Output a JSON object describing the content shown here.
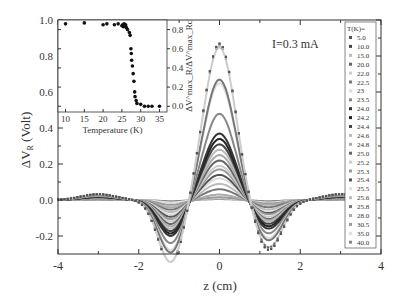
{
  "chart_data": {
    "type": "line",
    "title": "",
    "annotation": "I=0.3 mA",
    "xlabel": "z (cm)",
    "ylabel": "ΔV_R (Volt)",
    "xlim": [
      -4,
      4
    ],
    "ylim": [
      -0.3,
      1.0
    ],
    "xticks": [
      "-4",
      "-2",
      "0",
      "2",
      "4"
    ],
    "yticks": [
      "-0.2",
      "0.0",
      "0.2",
      "0.4",
      "0.6",
      "0.8",
      "1.0"
    ],
    "grid": false,
    "legend": {
      "title": "T(K)=",
      "position": "right-inside",
      "entries": [
        "5.0",
        "10.0",
        "15.0",
        "20.0",
        "22.0",
        "22.5",
        "23",
        "23.5",
        "24.0",
        "24.2",
        "24.4",
        "24.6",
        "24.8",
        "25.0",
        "25.2",
        "25.3",
        "25.4",
        "25.5",
        "25.6",
        "25.8",
        "28.0",
        "30.5",
        "35.0",
        "40.0"
      ]
    },
    "curve_shape": "peak at z=0, zero crossings near z=±0.8, negative dips near z=±1.2, small positive bumps near z=±3",
    "series": [
      {
        "name": "5.0",
        "peak": 0.87,
        "left_dip": -0.27,
        "right_dip": -0.21,
        "color": "#555555",
        "style": "dotted"
      },
      {
        "name": "10.0",
        "peak": 0.87,
        "left_dip": -0.27,
        "right_dip": -0.21,
        "color": "#444444",
        "style": "dotted"
      },
      {
        "name": "15.0",
        "peak": 0.86,
        "left_dip": -0.26,
        "right_dip": -0.21,
        "color": "#bbbbbb",
        "style": "dotted"
      },
      {
        "name": "20.0",
        "peak": 0.86,
        "left_dip": -0.26,
        "right_dip": -0.2,
        "color": "#666666",
        "style": "dotted"
      },
      {
        "name": "22.0",
        "peak": 0.85,
        "left_dip": -0.26,
        "right_dip": -0.2,
        "color": "#cccccc",
        "style": "solid"
      },
      {
        "name": "22.5",
        "peak": 0.67,
        "left_dip": -0.22,
        "right_dip": -0.17,
        "color": "#777777",
        "style": "solid"
      },
      {
        "name": "23",
        "peak": 0.65,
        "left_dip": -0.21,
        "right_dip": -0.16,
        "color": "#dddddd",
        "style": "solid"
      },
      {
        "name": "23.5",
        "peak": 0.48,
        "left_dip": -0.18,
        "right_dip": -0.14,
        "color": "#888888",
        "style": "solid"
      },
      {
        "name": "24.0",
        "peak": 0.37,
        "left_dip": -0.15,
        "right_dip": -0.12,
        "color": "#333333",
        "style": "solid"
      },
      {
        "name": "24.2",
        "peak": 0.34,
        "left_dip": -0.14,
        "right_dip": -0.11,
        "color": "#222222",
        "style": "solid"
      },
      {
        "name": "24.4",
        "peak": 0.31,
        "left_dip": -0.13,
        "right_dip": -0.1,
        "color": "#444444",
        "style": "solid"
      },
      {
        "name": "24.6",
        "peak": 0.28,
        "left_dip": -0.12,
        "right_dip": -0.09,
        "color": "#bbbbbb",
        "style": "solid"
      },
      {
        "name": "24.8",
        "peak": 0.25,
        "left_dip": -0.11,
        "right_dip": -0.085,
        "color": "#aaaaaa",
        "style": "solid"
      },
      {
        "name": "25.0",
        "peak": 0.22,
        "left_dip": -0.1,
        "right_dip": -0.08,
        "color": "#666666",
        "style": "solid"
      },
      {
        "name": "25.2",
        "peak": 0.19,
        "left_dip": -0.09,
        "right_dip": -0.07,
        "color": "#cccccc",
        "style": "solid"
      },
      {
        "name": "25.3",
        "peak": 0.17,
        "left_dip": -0.08,
        "right_dip": -0.06,
        "color": "#999999",
        "style": "solid"
      },
      {
        "name": "25.4",
        "peak": 0.14,
        "left_dip": -0.07,
        "right_dip": -0.055,
        "color": "#555555",
        "style": "solid"
      },
      {
        "name": "25.5",
        "peak": 0.12,
        "left_dip": -0.06,
        "right_dip": -0.05,
        "color": "#dddddd",
        "style": "solid"
      },
      {
        "name": "25.6",
        "peak": 0.09,
        "left_dip": -0.05,
        "right_dip": -0.04,
        "color": "#bbbbbb",
        "style": "solid"
      },
      {
        "name": "25.8",
        "peak": 0.06,
        "left_dip": -0.04,
        "right_dip": -0.03,
        "color": "#777777",
        "style": "solid"
      },
      {
        "name": "28.0",
        "peak": 0.03,
        "left_dip": -0.03,
        "right_dip": -0.02,
        "color": "#aaaaaa",
        "style": "solid"
      },
      {
        "name": "30.5",
        "peak": 0.015,
        "left_dip": -0.02,
        "right_dip": -0.015,
        "color": "#999999",
        "style": "solid"
      },
      {
        "name": "35.0",
        "peak": 0.01,
        "left_dip": -0.01,
        "right_dip": -0.01,
        "color": "#dddddd",
        "style": "solid"
      },
      {
        "name": "40.0",
        "peak": 0.005,
        "left_dip": -0.005,
        "right_dip": -0.005,
        "color": "#888888",
        "style": "solid"
      }
    ],
    "inset": {
      "type": "scatter",
      "xlabel": "Temperature (K)",
      "ylabel": "ΔV^max_R/ΔV^max_Rc",
      "xticks": [
        "10",
        "15",
        "20",
        "25",
        "30",
        "35"
      ],
      "yticks": [
        "0.0",
        "0.2",
        "0.4",
        "0.6",
        "0.8"
      ],
      "xlim": [
        8,
        37
      ],
      "ylim": [
        -0.06,
        0.9
      ],
      "x": [
        10,
        15,
        20,
        21,
        23,
        24,
        25,
        25.2,
        25.4,
        25.6,
        25.8,
        26,
        26.2,
        26.5,
        27,
        27.2,
        27.4,
        27.5,
        27.6,
        27.8,
        28,
        28.2,
        28.4,
        28.5,
        28.8,
        29,
        30,
        31,
        32,
        33,
        35
      ],
      "y": [
        0.86,
        0.87,
        0.85,
        0.86,
        0.85,
        0.86,
        0.84,
        0.85,
        0.83,
        0.86,
        0.84,
        0.85,
        0.82,
        0.8,
        0.77,
        0.74,
        0.6,
        0.55,
        0.48,
        0.42,
        0.34,
        0.26,
        0.15,
        0.1,
        0.06,
        0.03,
        0.02,
        0.0,
        0.0,
        0.0,
        0.0
      ]
    }
  }
}
